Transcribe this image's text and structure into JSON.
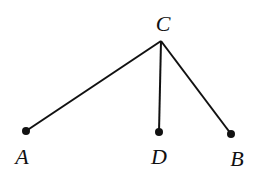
{
  "diagram": {
    "type": "tree",
    "points": {
      "C": {
        "label": "C",
        "x": 161,
        "y": 41,
        "label_x": 163,
        "label_y": 31
      },
      "A": {
        "label": "A",
        "x": 26,
        "y": 131,
        "label_x": 22,
        "label_y": 164
      },
      "D": {
        "label": "D",
        "x": 159,
        "y": 132,
        "label_x": 159,
        "label_y": 164
      },
      "B": {
        "label": "B",
        "x": 231,
        "y": 134,
        "label_x": 237,
        "label_y": 166
      }
    },
    "edges": [
      {
        "from": "C",
        "to": "A"
      },
      {
        "from": "C",
        "to": "D"
      },
      {
        "from": "C",
        "to": "B"
      }
    ],
    "colors": {
      "line": "#111111",
      "dot": "#111111",
      "background": "#ffffff"
    }
  }
}
